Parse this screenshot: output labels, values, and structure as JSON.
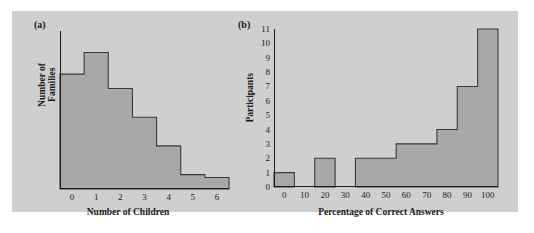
{
  "figure": {
    "background_color": "#ffffff",
    "panel_background_color": "#cfcfcf",
    "bar_fill_color": "#a8a8a8",
    "bar_stroke_color": "#3a3a3a",
    "axis_color": "#1a1a1a"
  },
  "panels": {
    "a": {
      "label": "(a)",
      "xlabel": "Number of Children",
      "ylabel": "Number of\nFamilies"
    },
    "b": {
      "label": "(b)",
      "xlabel": "Percentage of Correct Answers",
      "ylabel": "Participants"
    }
  },
  "chart_data": [
    {
      "id": "panel-a",
      "type": "bar",
      "title": "(a)",
      "xlabel": "Number of Children",
      "ylabel": "Number of Families",
      "categories": [
        "0",
        "1",
        "2",
        "3",
        "4",
        "5",
        "6"
      ],
      "x": [
        0,
        1,
        2,
        3,
        4,
        5,
        6
      ],
      "values": [
        8,
        9.5,
        7,
        5,
        3,
        1,
        0.8
      ],
      "xticklabels": [
        "0",
        "1",
        "2",
        "3",
        "4",
        "5",
        "6"
      ],
      "yticklabels": [],
      "xlim": [
        -0.5,
        6.5
      ],
      "ylim": [
        0,
        11
      ],
      "grid": false,
      "legend": null,
      "bin_width": 1,
      "note": "Histogram bars are contiguous; y-axis has no tick labels."
    },
    {
      "id": "panel-b",
      "type": "bar",
      "title": "(b)",
      "xlabel": "Percentage of Correct Answers",
      "ylabel": "Participants",
      "categories": [
        "0",
        "10",
        "20",
        "30",
        "40",
        "50",
        "60",
        "70",
        "80",
        "90",
        "100"
      ],
      "x": [
        0,
        10,
        20,
        30,
        40,
        50,
        60,
        70,
        80,
        90,
        100
      ],
      "values": [
        1,
        0,
        2,
        0,
        2,
        2,
        3,
        3,
        4,
        7,
        11
      ],
      "xticklabels": [
        "0",
        "10",
        "20",
        "30",
        "40",
        "50",
        "60",
        "70",
        "80",
        "90",
        "100"
      ],
      "yticklabels": [
        "0",
        "1",
        "2",
        "3",
        "4",
        "5",
        "6",
        "7",
        "8",
        "9",
        "10",
        "11"
      ],
      "yticks": [
        0,
        1,
        2,
        3,
        4,
        5,
        6,
        7,
        8,
        9,
        10,
        11
      ],
      "xlim": [
        -5,
        105
      ],
      "ylim": [
        0,
        11
      ],
      "grid": false,
      "legend": null,
      "bin_width": 10,
      "note": "Histogram bins centered on tick values, width 10; bins at 10 and 30 are empty."
    }
  ]
}
